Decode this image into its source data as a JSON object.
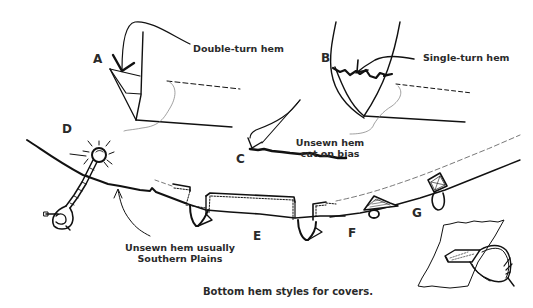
{
  "figure": {
    "caption": "Bottom hem styles for covers.",
    "background_color": "#ffffff",
    "ink_color": "#111111"
  },
  "labels": {
    "A": "A",
    "B": "B",
    "C": "C",
    "D": "D",
    "E": "E",
    "F": "F",
    "G": "G"
  },
  "annotations": {
    "double_turn": "Double-turn hem",
    "single_turn": "Single-turn hem",
    "bias_line1": "Unsewn hem",
    "bias_line2": "cut on bias",
    "plains_line1": "Unsewn hem usually",
    "plains_line2": "Southern Plains"
  },
  "icons": {
    "hem_a": "double-turn-hem-sketch",
    "hem_b": "single-turn-hem-sketch",
    "hem_c": "bias-cut-edge-sketch",
    "tie_d": "rope-tie-stone-sketch",
    "tabs_e": "fabric-tab-loops-sketch",
    "tab_f": "triangle-tab-loop-sketch",
    "tab_g": "square-tab-loop-sketch",
    "detail": "tab-loop-detail-sketch"
  }
}
